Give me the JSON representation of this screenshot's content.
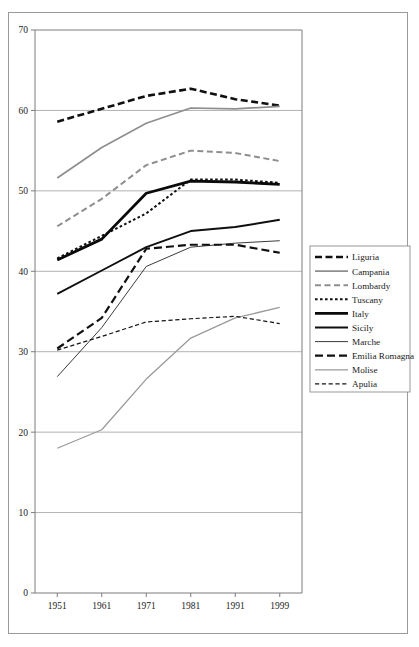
{
  "chart_data": {
    "type": "line",
    "title": "",
    "subtitle": "",
    "xlabel": "",
    "ylabel": "",
    "x": [
      1951,
      1961,
      1971,
      1981,
      1991,
      1999
    ],
    "xtick_labels": [
      "1951",
      "1961",
      "1971",
      "1981",
      "1991",
      "1999"
    ],
    "ytick_labels": [
      "0",
      "10",
      "20",
      "30",
      "40",
      "50",
      "60",
      "70"
    ],
    "yticks": [
      0,
      10,
      20,
      30,
      40,
      50,
      60,
      70
    ],
    "ylim": [
      0,
      70
    ],
    "grid": "horizontal",
    "legend_position": "right",
    "series": [
      {
        "name": "Liguria",
        "values": [
          58.6,
          60.2,
          61.8,
          62.7,
          61.4,
          60.6
        ],
        "color": "#101010",
        "width": 2.6,
        "dash": "7,3.5"
      },
      {
        "name": "Campania",
        "values": [
          51.6,
          55.4,
          58.4,
          60.3,
          60.2,
          60.5
        ],
        "color": "#8e8e8e",
        "width": 1.7,
        "dash": "none"
      },
      {
        "name": "Lombardy",
        "values": [
          45.6,
          49.0,
          53.2,
          55.0,
          54.7,
          53.7
        ],
        "color": "#8e8e8e",
        "width": 2.0,
        "dash": "6,3.5"
      },
      {
        "name": "Tuscany",
        "values": [
          41.6,
          44.4,
          47.2,
          51.4,
          51.4,
          51.0
        ],
        "color": "#101010",
        "width": 2.0,
        "dash": "2.6,2.4"
      },
      {
        "name": "Italy",
        "values": [
          41.4,
          44.0,
          49.7,
          51.2,
          51.1,
          50.8
        ],
        "color": "#0a0a0a",
        "width": 2.8,
        "dash": "none"
      },
      {
        "name": "Sicily",
        "values": [
          37.2,
          40.1,
          43.0,
          45.0,
          45.5,
          46.4
        ],
        "color": "#0f0f0f",
        "width": 1.9,
        "dash": "none"
      },
      {
        "name": "Marche",
        "values": [
          26.9,
          33.0,
          40.6,
          43.0,
          43.5,
          43.8
        ],
        "color": "#303030",
        "width": 0.95,
        "dash": "none"
      },
      {
        "name": "Emilia Romagna",
        "values": [
          30.4,
          34.2,
          42.8,
          43.3,
          43.3,
          42.3
        ],
        "color": "#101010",
        "width": 2.2,
        "dash": "8,4"
      },
      {
        "name": "Molise",
        "values": [
          18.0,
          20.3,
          26.6,
          31.7,
          34.2,
          35.5
        ],
        "color": "#9a9a9a",
        "width": 1.3,
        "dash": "none"
      },
      {
        "name": "Apulia",
        "values": [
          30.2,
          31.9,
          33.7,
          34.1,
          34.4,
          33.5
        ],
        "color": "#141414",
        "width": 1.2,
        "dash": "4.2,2.6"
      }
    ]
  },
  "legend": {
    "items": [
      {
        "label": "Liguria"
      },
      {
        "label": "Campania"
      },
      {
        "label": "Lombardy"
      },
      {
        "label": "Tuscany"
      },
      {
        "label": "Italy"
      },
      {
        "label": "Sicily"
      },
      {
        "label": "Marche"
      },
      {
        "label": "Emilia Romagna"
      },
      {
        "label": "Molise"
      },
      {
        "label": "Apulia"
      }
    ]
  },
  "colors": {
    "black": "#101010",
    "gray": "#8e8e8e",
    "light_gray": "#9a9a9a",
    "grid": "#a8a8a8",
    "axis": "#7d7d7d",
    "frame": "#9b9b9b",
    "background": "#ffffff"
  }
}
